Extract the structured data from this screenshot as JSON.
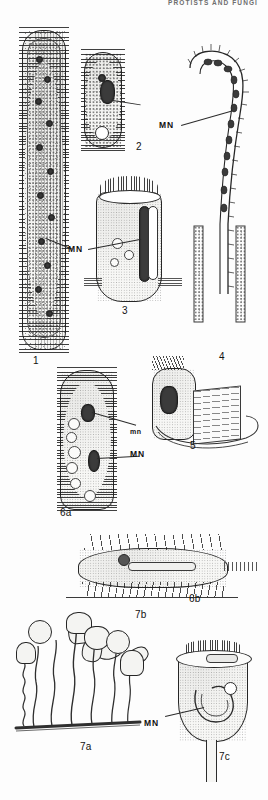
{
  "page": {
    "running_head": "PROTISTS AND FUNGI",
    "background_color": "#fdfdfd",
    "ink_color": "#1a1a1a",
    "width": 268,
    "height": 800,
    "plate_type": "scientific line-drawing illustration plate"
  },
  "figures": [
    {
      "id": "1",
      "number": "1",
      "name": "elongate-ciliate",
      "description": "Very elongate worm-like ciliate with longitudinal striations, dense granular endoplasm and a band of dark nuclear nodes"
    },
    {
      "id": "2",
      "number": "2",
      "name": "ovoid-ciliate",
      "description": "Small ovoid ciliate with dense cortical granules, dark macronucleus and a clear contractile vacuole"
    },
    {
      "id": "3",
      "number": "3",
      "name": "barrel-ciliate",
      "description": "Barrel-shaped ciliate with a crown of long oral cilia and a ribbon-like macronucleus"
    },
    {
      "id": "4",
      "number": "4",
      "name": "hook-shaped-ciliate",
      "description": "Long hook-curved ciliate with beaded chain of macronuclear nodes and ciliary fringe"
    },
    {
      "id": "5",
      "number": "5",
      "name": "ribbed-ciliate",
      "description": "Ciliate with prominent ribbed lamellar organelle and looping girdle"
    },
    {
      "id": "6a",
      "number": "6a",
      "name": "hypotrich-dorsal-view",
      "description": "Hypotrich ciliate, dorsal aspect, showing micronucleus and macronucleus"
    },
    {
      "id": "6b",
      "number": "6b",
      "name": "hypotrich-lateral-view",
      "description": "Same hypotrich in lateral aspect, walking on ventral cirri"
    },
    {
      "id": "7a",
      "number": "7a",
      "name": "stalked-colony",
      "description": "Colony of stalked peritrich ciliates on a substrate filament"
    },
    {
      "id": "7b",
      "number": "7b",
      "name": "free-swimming-telotrochs",
      "description": "Detached free-swimming telotroch stages"
    },
    {
      "id": "7c",
      "number": "7c",
      "name": "bell-zooid-detail",
      "description": "Enlarged bell-shaped zooid showing the horseshoe macronucleus"
    }
  ],
  "annotations": [
    {
      "id": "mn-fig1",
      "text": "MN",
      "case": "upper",
      "meaning": "macronucleus",
      "points_to": "1"
    },
    {
      "id": "mn-fig2",
      "text": "MN",
      "case": "upper",
      "meaning": "macronucleus",
      "points_to": "2"
    },
    {
      "id": "mn-fig6a-micro",
      "text": "mn",
      "case": "lower",
      "meaning": "micronucleus",
      "points_to": "6a"
    },
    {
      "id": "mn-fig6a-macro",
      "text": "MN",
      "case": "upper",
      "meaning": "macronucleus",
      "points_to": "6a"
    },
    {
      "id": "mn-fig7c",
      "text": "MN",
      "case": "upper",
      "meaning": "macronucleus",
      "points_to": "7c"
    }
  ],
  "figure_numbers": {
    "f1": "1",
    "f2": "2",
    "f3": "3",
    "f4": "4",
    "f5": "5",
    "f6a": "6a",
    "f6b": "6b",
    "f7a": "7a",
    "f7b": "7b",
    "f7c": "7c"
  }
}
